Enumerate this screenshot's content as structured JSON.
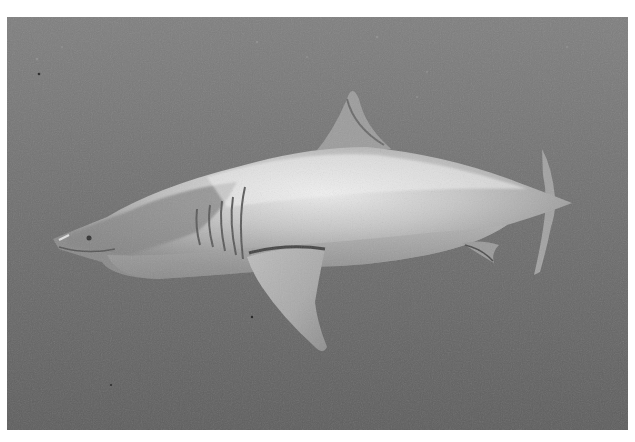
{
  "image": {
    "subject": "great white shark swimming underwater",
    "alt": "Grayscale photograph of a great white shark swimming left through open water, viewed from the side and slightly below",
    "colors": {
      "water_top": "#7d7d7d",
      "water_bottom": "#5f5f5f",
      "body_light": "#e6e6e6",
      "body_mid": "#b4b4b4",
      "body_dark": "#6e6e6e",
      "fin": "#c8c8c8"
    }
  }
}
